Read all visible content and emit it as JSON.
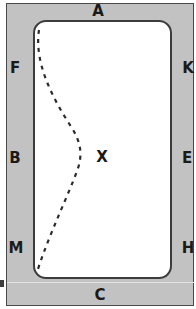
{
  "diagram": {
    "colors": {
      "frame_fill": "#c2c2c2",
      "frame_stroke": "#4a4a4a",
      "panel_fill": "#ffffff",
      "panel_stroke": "#3c3c3c",
      "curve_stroke": "#2b2b2b",
      "label_color": "#1a1a1a",
      "seam_color": "#e2e2e2"
    },
    "labels": {
      "top": "A",
      "bottom": "C",
      "left_upper": "F",
      "left_middle": "B",
      "left_lower": "M",
      "right_upper": "K",
      "right_middle": "E",
      "right_lower": "H",
      "center": "X"
    },
    "curve": {
      "style": "dashed",
      "dash_pattern": "4 5",
      "stroke_width": 2.2,
      "path": "M 39 30 C 34 62, 52 98, 72 128 C 81 143, 83 155, 77 171 C 68 196, 50 232, 37 272"
    }
  }
}
